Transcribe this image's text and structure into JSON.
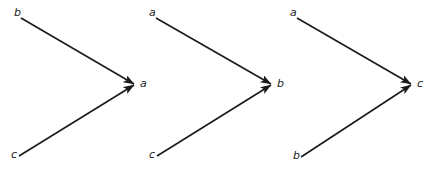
{
  "figure": {
    "title": "",
    "background_color": "#ffffff",
    "stroke_color": "#1a1a1a",
    "width": 427,
    "height": 170,
    "diagram_count": 3
  },
  "diagrams": [
    {
      "id": "diagram-1",
      "target_label": "a",
      "source_top_label": "b",
      "source_bottom_label": "c",
      "nodes": [
        {
          "name": "b",
          "x": 14,
          "y": 13,
          "role": "source-top"
        },
        {
          "name": "c",
          "x": 11,
          "y": 155,
          "role": "source-bottom"
        },
        {
          "name": "a",
          "x": 140,
          "y": 84,
          "role": "target"
        }
      ],
      "edges": [
        {
          "from": "b",
          "to": "a",
          "x1": 21,
          "y1": 18,
          "x2": 134,
          "y2": 84
        },
        {
          "from": "c",
          "to": "a",
          "x1": 19,
          "y1": 156,
          "x2": 134,
          "y2": 85
        }
      ]
    },
    {
      "id": "diagram-2",
      "target_label": "b",
      "source_top_label": "a",
      "source_bottom_label": "c",
      "nodes": [
        {
          "name": "a",
          "x": 149,
          "y": 13,
          "role": "source-top"
        },
        {
          "name": "c",
          "x": 149,
          "y": 155,
          "role": "source-bottom"
        },
        {
          "name": "b",
          "x": 277,
          "y": 84,
          "role": "target"
        }
      ],
      "edges": [
        {
          "from": "a",
          "to": "b",
          "x1": 156,
          "y1": 18,
          "x2": 271,
          "y2": 84
        },
        {
          "from": "c",
          "to": "b",
          "x1": 157,
          "y1": 156,
          "x2": 271,
          "y2": 85
        }
      ]
    },
    {
      "id": "diagram-3",
      "target_label": "c",
      "source_top_label": "a",
      "source_bottom_label": "b",
      "nodes": [
        {
          "name": "a",
          "x": 290,
          "y": 13,
          "role": "source-top"
        },
        {
          "name": "b",
          "x": 293,
          "y": 156,
          "role": "source-bottom"
        },
        {
          "name": "c",
          "x": 417,
          "y": 84,
          "role": "target"
        }
      ],
      "edges": [
        {
          "from": "a",
          "to": "c",
          "x1": 297,
          "y1": 18,
          "x2": 411,
          "y2": 84
        },
        {
          "from": "b",
          "to": "c",
          "x1": 301,
          "y1": 157,
          "x2": 411,
          "y2": 85
        }
      ]
    }
  ]
}
